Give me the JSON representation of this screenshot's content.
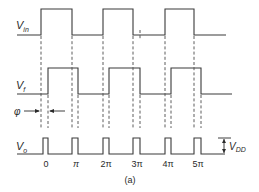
{
  "figure": {
    "caption": "(a)",
    "signals": {
      "vin": {
        "label_main": "V",
        "label_sub": "in"
      },
      "vf": {
        "label_main": "V",
        "label_sub": "f"
      },
      "vo": {
        "label_main": "V",
        "label_sub": "o"
      }
    },
    "phase_label": "φ",
    "amplitude_label": {
      "main": "V",
      "sub": "DD"
    },
    "x_ticks": [
      "0",
      "π",
      "2π",
      "3π",
      "4π",
      "5π"
    ],
    "colors": {
      "stroke": "#3a3a3a",
      "background": "#ffffff"
    }
  }
}
